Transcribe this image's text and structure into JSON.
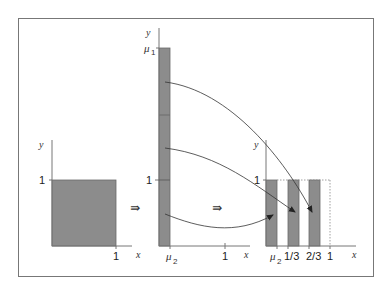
{
  "colors": {
    "background": "#ffffff",
    "frame": "#777777",
    "axis": "#777777",
    "fill": "#8c8c8c",
    "fill_stroke": "#666666",
    "arrow": "#333333",
    "dotted": "#888888"
  },
  "panels": [
    {
      "id": "unit-square",
      "y_axis_label": "y",
      "x_axis_label": "x",
      "y_tick_label": "1",
      "x_tick_label": "1"
    },
    {
      "id": "tall-strip",
      "y_axis_label": "y",
      "x_axis_label": "x",
      "y_top_label_base": "μ",
      "y_top_label_sub": "1",
      "y_tick_label": "1",
      "x_strip_label_base": "μ",
      "x_strip_label_sub": "2",
      "x_tick_label": "1"
    },
    {
      "id": "three-strips",
      "y_axis_label": "y",
      "x_axis_label": "x",
      "y_tick_label": "1",
      "x_labels": {
        "mu_base": "μ",
        "mu_sub": "2",
        "one_third": "1/3",
        "two_thirds": "2/3",
        "one": "1"
      }
    }
  ],
  "transitions": [
    {
      "id": "transition-1",
      "symbol": "⇛"
    },
    {
      "id": "transition-2",
      "symbol": "⇛"
    }
  ],
  "mapping_arrows": [
    {
      "id": "arrow-top",
      "from": "upper strip segment",
      "to": "third strip"
    },
    {
      "id": "arrow-middle",
      "from": "middle strip segment",
      "to": "second strip"
    },
    {
      "id": "arrow-bottom",
      "from": "lower strip segment",
      "to": "first strip"
    }
  ]
}
